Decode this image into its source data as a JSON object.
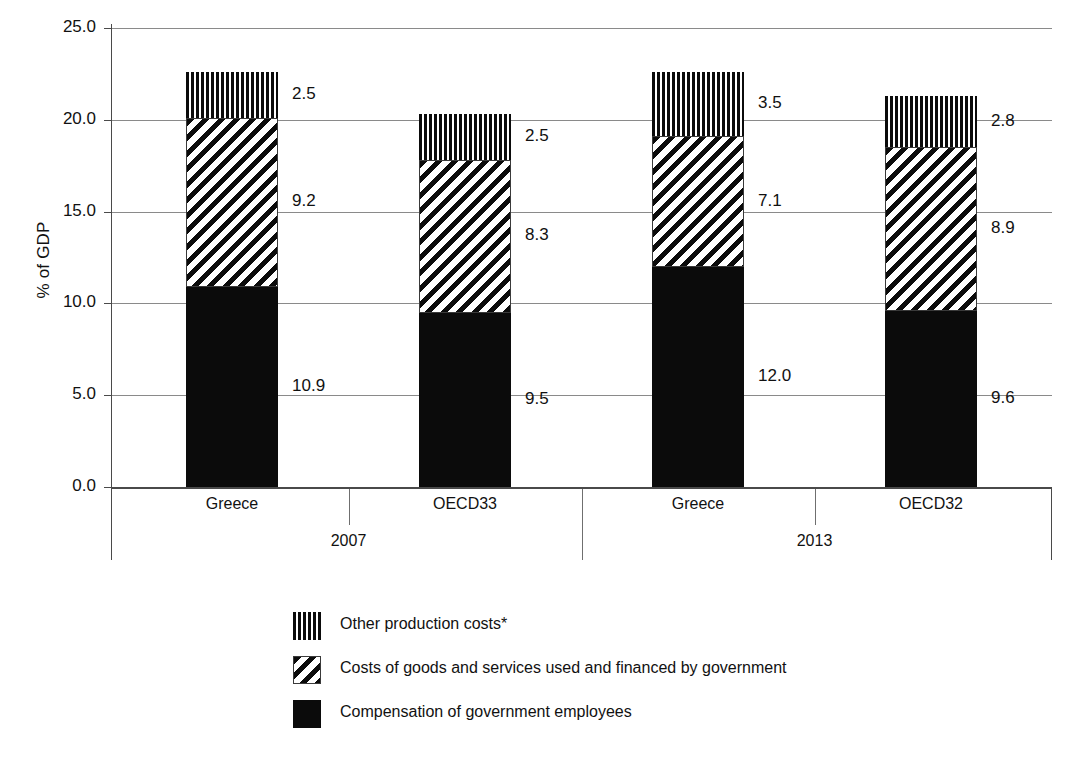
{
  "chart_data": {
    "type": "bar",
    "subtype": "stacked-bar",
    "title": "",
    "xlabel": "",
    "ylabel": "% of GDP",
    "ylim": [
      0.0,
      25.0
    ],
    "ytick_labels": [
      "25.0",
      "20.0",
      "15.0",
      "10.0",
      "5.0",
      "0.0"
    ],
    "ytick_values": [
      25.0,
      20.0,
      15.0,
      10.0,
      5.0,
      0.0
    ],
    "grid": true,
    "legend_position": "bottom",
    "categories": [
      "Greece",
      "OECD33",
      "Greece",
      "OECD32"
    ],
    "groups": [
      {
        "label": "2007",
        "categories": [
          "Greece",
          "OECD33"
        ]
      },
      {
        "label": "2013",
        "categories": [
          "Greece",
          "OECD32"
        ]
      }
    ],
    "series": [
      {
        "name": "Compensation of government employees",
        "pattern": "solid-black",
        "values": [
          10.9,
          9.5,
          12.0,
          9.6
        ],
        "value_labels": [
          "10.9",
          "9.5",
          "12.0",
          "9.6"
        ]
      },
      {
        "name": "Costs of goods and services used and financed by government",
        "pattern": "diagonal-stripes",
        "values": [
          9.2,
          8.3,
          7.1,
          8.9
        ],
        "value_labels": [
          "9.2",
          "8.3",
          "7.1",
          "8.9"
        ]
      },
      {
        "name": "Other production costs*",
        "pattern": "vertical-stripes",
        "values": [
          2.5,
          2.5,
          3.5,
          2.8
        ],
        "value_labels": [
          "2.5",
          "2.5",
          "3.5",
          "2.8"
        ]
      }
    ],
    "totals": [
      22.6,
      20.3,
      22.6,
      21.3
    ],
    "colors": {
      "fill": "#0b0b0b",
      "background": "#ffffff",
      "grid": "#8a8a8a",
      "axis": "#4a4a4a"
    }
  },
  "axis": {
    "y_title": "% of GDP",
    "ticks": [
      {
        "label": "25.0",
        "value": 25.0
      },
      {
        "label": "20.0",
        "value": 20.0
      },
      {
        "label": "15.0",
        "value": 15.0
      },
      {
        "label": "10.0",
        "value": 10.0
      },
      {
        "label": "5.0",
        "value": 5.0
      },
      {
        "label": "0.0",
        "value": 0.0
      }
    ]
  },
  "categories": [
    {
      "label": "Greece"
    },
    {
      "label": "OECD33"
    },
    {
      "label": "Greece"
    },
    {
      "label": "OECD32"
    }
  ],
  "group_labels": [
    {
      "label": "2007"
    },
    {
      "label": "2013"
    }
  ],
  "bars": [
    {
      "category": "Greece",
      "group": "2007",
      "segments": [
        {
          "series": "Other production costs*",
          "pattern": "vertical-stripes",
          "value": 2.5,
          "label": "2.5"
        },
        {
          "series": "Costs of goods and services used and financed by government",
          "pattern": "diagonal-stripes",
          "value": 9.2,
          "label": "9.2"
        },
        {
          "series": "Compensation of government employees",
          "pattern": "solid-black",
          "value": 10.9,
          "label": "10.9"
        }
      ]
    },
    {
      "category": "OECD33",
      "group": "2007",
      "segments": [
        {
          "series": "Other production costs*",
          "pattern": "vertical-stripes",
          "value": 2.5,
          "label": "2.5"
        },
        {
          "series": "Costs of goods and services used and financed by government",
          "pattern": "diagonal-stripes",
          "value": 8.3,
          "label": "8.3"
        },
        {
          "series": "Compensation of government employees",
          "pattern": "solid-black",
          "value": 9.5,
          "label": "9.5"
        }
      ]
    },
    {
      "category": "Greece",
      "group": "2013",
      "segments": [
        {
          "series": "Other production costs*",
          "pattern": "vertical-stripes",
          "value": 3.5,
          "label": "3.5"
        },
        {
          "series": "Costs of goods and services used and financed by government",
          "pattern": "diagonal-stripes",
          "value": 7.1,
          "label": "7.1"
        },
        {
          "series": "Compensation of government employees",
          "pattern": "solid-black",
          "value": 12.0,
          "label": "12.0"
        }
      ]
    },
    {
      "category": "OECD32",
      "group": "2013",
      "segments": [
        {
          "series": "Other production costs*",
          "pattern": "vertical-stripes",
          "value": 2.8,
          "label": "2.8"
        },
        {
          "series": "Costs of goods and services used and financed by government",
          "pattern": "diagonal-stripes",
          "value": 8.9,
          "label": "8.9"
        },
        {
          "series": "Compensation of government employees",
          "pattern": "solid-black",
          "value": 9.6,
          "label": "9.6"
        }
      ]
    }
  ],
  "legend": {
    "items": [
      {
        "label": "Other production costs*",
        "pattern": "vertical-stripes"
      },
      {
        "label": "Costs of goods and services used and financed by government",
        "pattern": "diagonal-stripes"
      },
      {
        "label": "Compensation of government employees",
        "pattern": "solid-black"
      }
    ]
  }
}
